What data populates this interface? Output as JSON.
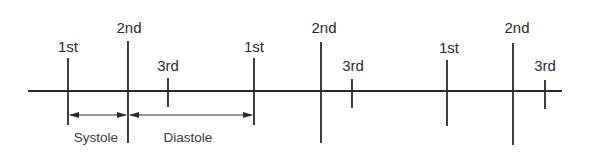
{
  "diagram": {
    "type": "timeline",
    "colors": {
      "line": "#2a2a2a",
      "text": "#2a2a2a"
    },
    "sounds": [
      {
        "label": "1st",
        "x": 68
      },
      {
        "label": "2nd",
        "x": 128
      },
      {
        "label": "3rd",
        "x": 168
      },
      {
        "label": "1st",
        "x": 254
      },
      {
        "label": "2nd",
        "x": 321
      },
      {
        "label": "3rd",
        "x": 352
      },
      {
        "label": "1st",
        "x": 447
      },
      {
        "label": "2nd",
        "x": 513
      },
      {
        "label": "3rd",
        "x": 545
      }
    ],
    "intervals": [
      {
        "label": "Systole",
        "from": "1st",
        "to": "2nd"
      },
      {
        "label": "Diastole",
        "from": "2nd",
        "to": "1st"
      }
    ]
  }
}
